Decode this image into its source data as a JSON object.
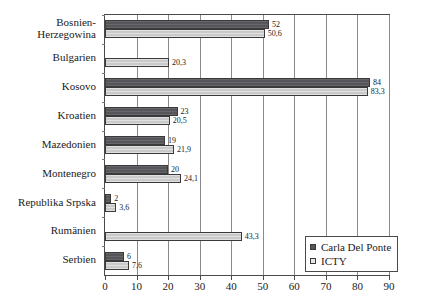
{
  "chart_data": {
    "type": "bar",
    "orientation": "horizontal",
    "title": "",
    "subtitle": "",
    "xlabel": "",
    "ylabel": "",
    "xlim": [
      0,
      90
    ],
    "xticks": [
      0,
      10,
      20,
      30,
      40,
      50,
      60,
      70,
      80,
      90
    ],
    "xtick_labels": [
      "0",
      "10",
      "20",
      "30",
      "40",
      "50",
      "60",
      "70",
      "80",
      "90"
    ],
    "grid": true,
    "grid_axis": "x",
    "legend_position": "bottom-right",
    "categories": [
      "Bosnien-Herzegowina",
      "Bulgarien",
      "Kosovo",
      "Kroatien",
      "Mazedonien",
      "Montenegro",
      "Republika Srpska",
      "Rumänien",
      "Serbien"
    ],
    "category_lines": [
      [
        "Bosnien-",
        "Herzegowina"
      ],
      [
        "Bulgarien"
      ],
      [
        "Kosovo"
      ],
      [
        "Kroatien"
      ],
      [
        "Mazedonien"
      ],
      [
        "Montenegro"
      ],
      [
        "Republika Srpska"
      ],
      [
        "Rumänien"
      ],
      [
        "Serbien"
      ]
    ],
    "series": [
      {
        "name": "Carla Del Ponte",
        "color": "#55555a",
        "values": [
          52,
          null,
          84,
          23,
          19,
          20,
          2,
          null,
          6
        ],
        "value_labels": [
          "52",
          "",
          "84",
          "23",
          "19",
          "20",
          "2",
          "",
          "6"
        ]
      },
      {
        "name": "ICTY",
        "color": "#c9c9c9",
        "values": [
          50.6,
          20.3,
          83.3,
          20.5,
          21.9,
          24.1,
          3.6,
          43.3,
          7.6
        ],
        "value_labels": [
          "50,6",
          "20,3",
          "83,3",
          "20,5",
          "21,9",
          "24,1",
          "3,6",
          "43,3",
          "7,6"
        ]
      }
    ]
  },
  "legend": {
    "entries": [
      {
        "label": "Carla Del Ponte"
      },
      {
        "label": "ICTY"
      }
    ]
  }
}
